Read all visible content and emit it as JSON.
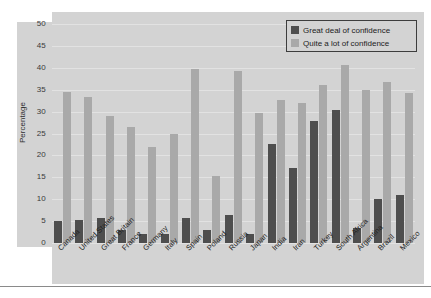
{
  "chart_data": {
    "type": "bar",
    "title": "",
    "subtitle": "",
    "xlabel": "",
    "ylabel": "Percentage",
    "ylim": [
      0,
      50
    ],
    "ytick_labels": [
      "50",
      "45",
      "40",
      "35",
      "30",
      "25",
      "20",
      "15",
      "10",
      "5",
      "0"
    ],
    "yticks": [
      50,
      45,
      40,
      35,
      30,
      25,
      20,
      15,
      10,
      5,
      0
    ],
    "grid": true,
    "legend_position": "top-right",
    "categories": [
      "Canada",
      "United States",
      "Great Britain",
      "France",
      "Germany",
      "Italy",
      "Spain",
      "Poland",
      "Russia",
      "Japan",
      "India",
      "Iran",
      "Turkey",
      "South Africa",
      "Argentina",
      "Brazil",
      "Mexico"
    ],
    "series": [
      {
        "name": "Great deal of confidence",
        "color": "#4e4e4e",
        "values": [
          5,
          5.2,
          5.8,
          3,
          2,
          2,
          5.7,
          3,
          6.5,
          2,
          22.7,
          17.2,
          27.8,
          30.4,
          3.5,
          10,
          11
        ]
      },
      {
        "name": "Quite a lot of confidence",
        "color": "#a9a9a9",
        "values": [
          34.5,
          33.3,
          29,
          26.5,
          22,
          24.8,
          39.8,
          15.4,
          39.2,
          29.6,
          32.6,
          31.9,
          36.1,
          40.6,
          34.9,
          36.7,
          34.2
        ]
      }
    ]
  },
  "legend": {
    "entries": [
      {
        "label": "Great deal of confidence",
        "color": "#4e4e4e"
      },
      {
        "label": "Quite a lot of confidence",
        "color": "#a9a9a9"
      }
    ]
  },
  "colors": {
    "panel_background": "#d3d3d3",
    "gridline": "#e2e2e2",
    "page_background": "#ffffff",
    "rule": "#8a8a8a",
    "series_dark": "#4e4e4e",
    "series_light": "#a9a9a9"
  }
}
